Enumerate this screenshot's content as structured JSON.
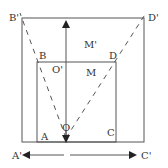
{
  "diagram": {
    "labels": {
      "B_prime": "B'",
      "D_prime": "D'",
      "B": "B",
      "D": "D",
      "M_prime": "M'",
      "O_prime": "O'",
      "M": "M",
      "A": "A",
      "C": "C",
      "O": "O",
      "A_prime": "A'",
      "C_prime": "C'"
    },
    "colors": {
      "stroke": "#555555",
      "text": "#333333",
      "background": "#ffffff"
    }
  }
}
